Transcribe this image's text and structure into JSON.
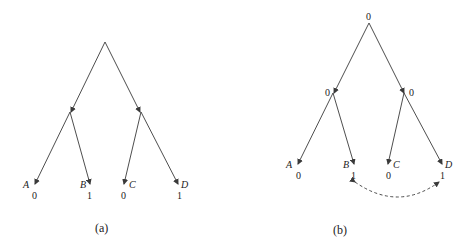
{
  "panels": [
    {
      "caption": "(a)",
      "root_label": "",
      "internal_labels": [
        "",
        ""
      ],
      "leaves": [
        {
          "name": "A",
          "value": "0"
        },
        {
          "name": "B",
          "value": "1"
        },
        {
          "name": "C",
          "value": "0"
        },
        {
          "name": "D",
          "value": "1"
        }
      ]
    },
    {
      "caption": "(b)",
      "root_label": "0",
      "internal_labels": [
        "0",
        "0"
      ],
      "leaves": [
        {
          "name": "A",
          "value": "0"
        },
        {
          "name": "B",
          "value": "1"
        },
        {
          "name": "C",
          "value": "0"
        },
        {
          "name": "D",
          "value": "1"
        }
      ],
      "dashed_link": {
        "from": "B",
        "to": "D"
      }
    }
  ],
  "colors": {
    "line": "#3a3a3a",
    "text": "#222222",
    "background": "#ffffff"
  }
}
